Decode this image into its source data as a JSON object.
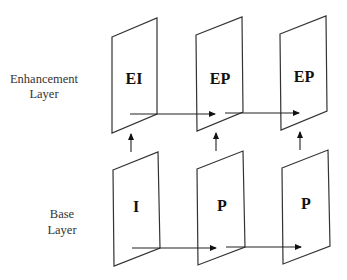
{
  "layers": {
    "enhancement": {
      "label_line1": "Enhancement",
      "label_line2": "Layer"
    },
    "base": {
      "label_line1": "Base",
      "label_line2": "Layer"
    }
  },
  "frames": {
    "enhancement": [
      {
        "label": "EI"
      },
      {
        "label": "EP"
      },
      {
        "label": "EP"
      }
    ],
    "base": [
      {
        "label": "I"
      },
      {
        "label": "P"
      },
      {
        "label": "P"
      }
    ]
  },
  "colors": {
    "stroke": "#333333",
    "text": "#111111",
    "background": "#ffffff"
  }
}
